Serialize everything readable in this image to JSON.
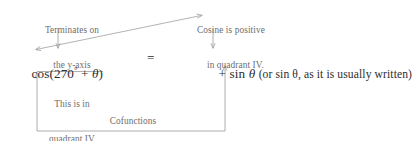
{
  "figure": {
    "background_color": "#ffffff",
    "annotation_color": "#6e6e6e",
    "equation_color": "#2e2e2e",
    "line_color": "#9a9a9a"
  },
  "annotations": {
    "terminates": {
      "line1": "Terminates on",
      "line2": "the y-axis"
    },
    "cosine_positive": {
      "line1": "Cosine is positive",
      "line2": "in quadrant IV."
    },
    "quadrant_note": {
      "line1": "This is in",
      "line2": "quadrant IV",
      "line3": "for small θ."
    },
    "cofunctions": {
      "label": "Cofunctions"
    }
  },
  "equation": {
    "left_side": {
      "function": "cos",
      "open_paren": "(",
      "angle": "270",
      "degree_symbol": "°",
      "operator": " + ",
      "variable": "θ",
      "close_paren": ")",
      "full_text": "cos(270° + θ)"
    },
    "relation": "=",
    "right_side": {
      "sign": "+",
      "function": "sin",
      "variable": "θ",
      "parenthetical": "(or sin θ, as it is usually written)",
      "full_text": "+ sin θ (or sin θ, as it is usually written)"
    }
  },
  "connectors": {
    "diagonal_arrow": "arrow-from-cosine-note-to-left-angle",
    "down_arrow_left": "arrow-to-angle-expression",
    "down_arrow_right": "arrow-to-sine-expression",
    "underline_left": "brace-under-angle-expression",
    "cofunction_bracket": "bracket-linking-cos-and-sin"
  }
}
